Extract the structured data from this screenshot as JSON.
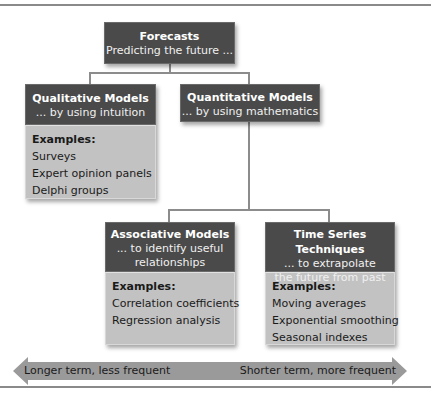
{
  "diagram": {
    "root": {
      "title": "Forecasts",
      "subtitle": "Predicting the future ..."
    },
    "qualitative": {
      "title": "Qualitative Models",
      "subtitle": "... by using intuition",
      "examples_label": "Examples:",
      "examples": [
        "Surveys",
        "Expert opinion panels",
        "Delphi groups"
      ]
    },
    "quantitative": {
      "title": "Quantitative Models",
      "subtitle": "... by using mathematics"
    },
    "associative": {
      "title": "Associative Models",
      "subtitle_line1": "... to identify useful",
      "subtitle_line2": "relationships",
      "examples_label": "Examples:",
      "examples": [
        "Correlation coefficients",
        "Regression analysis"
      ]
    },
    "time_series": {
      "title": "Time Series Techniques",
      "subtitle_line1": "... to extrapolate",
      "subtitle_line2": "the future from past",
      "examples_label": "Examples:",
      "examples": [
        "Moving averages",
        "Exponential smoothing",
        "Seasonal indexes"
      ]
    },
    "arrow": {
      "left_label": "Longer term, less frequent",
      "right_label": "Shorter term, more frequent"
    }
  },
  "colors": {
    "header_bg": "#4a4a4a",
    "body_bg": "#c2c2c2",
    "connector": "#8c8c8c",
    "arrow": "#9a9a9a"
  }
}
